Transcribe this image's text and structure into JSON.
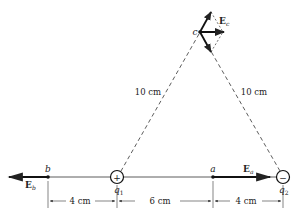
{
  "diagram": {
    "type": "electric-field-two-point-charges",
    "charges": [
      {
        "id": "q1",
        "label": "q",
        "subscript": "1",
        "sign": "+"
      },
      {
        "id": "q2",
        "label": "q",
        "subscript": "2",
        "sign": "−"
      }
    ],
    "points": [
      {
        "id": "a",
        "label": "a"
      },
      {
        "id": "b",
        "label": "b"
      },
      {
        "id": "c",
        "label": "c"
      }
    ],
    "fields": [
      {
        "id": "Ea",
        "label": "E",
        "subscript": "a"
      },
      {
        "id": "Eb",
        "label": "E",
        "subscript": "b"
      },
      {
        "id": "Ec",
        "label": "E",
        "subscript": "c"
      }
    ],
    "distances": {
      "c_to_q1": "10 cm",
      "c_to_q2": "10 cm",
      "b_to_q1": "4 cm",
      "q1_to_a": "6 cm",
      "a_to_q2": "4 cm"
    },
    "colors": {
      "ink": "#222222",
      "background": "#ffffff"
    }
  }
}
